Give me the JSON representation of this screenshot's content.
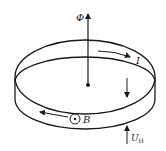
{
  "diagram": {
    "labels": {
      "flux": "Φ",
      "current": "I",
      "field": "B",
      "hall_voltage_main": "U",
      "hall_voltage_sub": "H"
    },
    "colors": {
      "stroke": "#1a1a1a",
      "background": "#ffffff"
    }
  }
}
